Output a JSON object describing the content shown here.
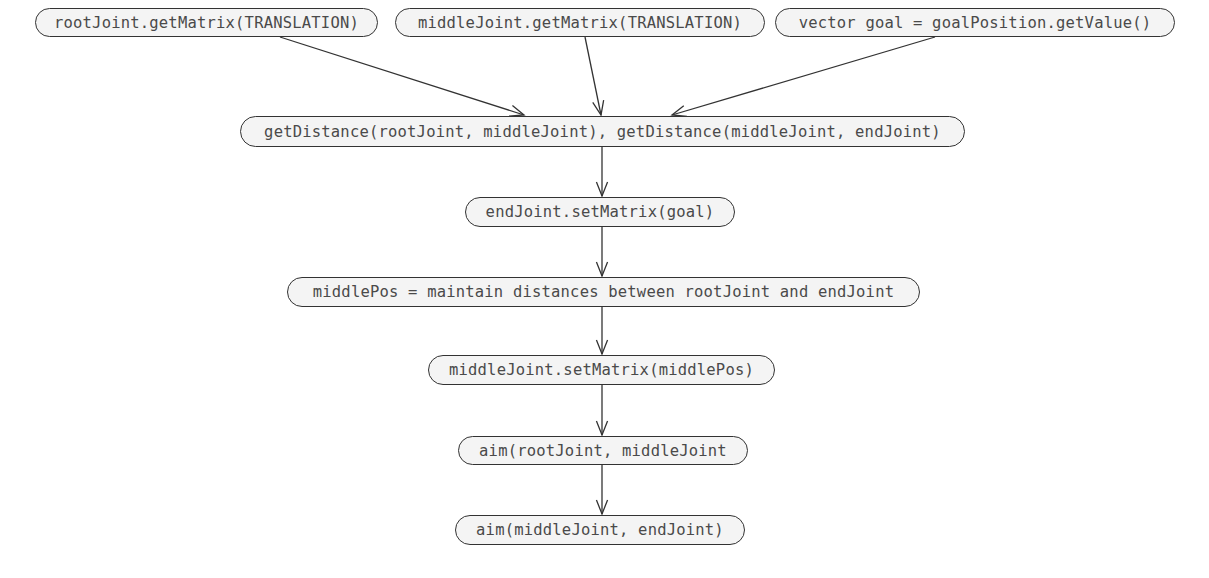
{
  "diagram": {
    "type": "flowchart",
    "nodes": [
      {
        "id": "n1",
        "label": "rootJoint.getMatrix(TRANSLATION)",
        "x": 35,
        "y": 8,
        "w": 343,
        "h": 29
      },
      {
        "id": "n2",
        "label": "middleJoint.getMatrix(TRANSLATION)",
        "x": 395,
        "y": 8,
        "w": 370,
        "h": 29
      },
      {
        "id": "n3",
        "label": "vector goal = goalPosition.getValue()",
        "x": 775,
        "y": 8,
        "w": 400,
        "h": 29
      },
      {
        "id": "n4",
        "label": "getDistance(rootJoint, middleJoint), getDistance(middleJoint, endJoint)",
        "x": 240,
        "y": 116,
        "w": 725,
        "h": 31
      },
      {
        "id": "n5",
        "label": "endJoint.setMatrix(goal)",
        "x": 465,
        "y": 197,
        "w": 270,
        "h": 30
      },
      {
        "id": "n6",
        "label": "middlePos = maintain distances between rootJoint and endJoint",
        "x": 287,
        "y": 277,
        "w": 633,
        "h": 30
      },
      {
        "id": "n7",
        "label": "middleJoint.setMatrix(middlePos)",
        "x": 428,
        "y": 355,
        "w": 347,
        "h": 30
      },
      {
        "id": "n8",
        "label": "aim(rootJoint, middleJoint",
        "x": 458,
        "y": 436,
        "w": 290,
        "h": 29
      },
      {
        "id": "n9",
        "label": "aim(middleJoint, endJoint)",
        "x": 455,
        "y": 515,
        "w": 290,
        "h": 30
      }
    ],
    "edges": [
      {
        "from": "n1",
        "to": "n4",
        "x1": 280,
        "y1": 37,
        "x2": 524,
        "y2": 115
      },
      {
        "from": "n2",
        "to": "n4",
        "x1": 585,
        "y1": 37,
        "x2": 601,
        "y2": 115
      },
      {
        "from": "n3",
        "to": "n4",
        "x1": 935,
        "y1": 37,
        "x2": 672,
        "y2": 115
      },
      {
        "from": "n4",
        "to": "n5",
        "x1": 602,
        "y1": 147,
        "x2": 602,
        "y2": 196
      },
      {
        "from": "n5",
        "to": "n6",
        "x1": 602,
        "y1": 227,
        "x2": 602,
        "y2": 276
      },
      {
        "from": "n6",
        "to": "n7",
        "x1": 602,
        "y1": 307,
        "x2": 602,
        "y2": 354
      },
      {
        "from": "n7",
        "to": "n8",
        "x1": 602,
        "y1": 385,
        "x2": 602,
        "y2": 435
      },
      {
        "from": "n8",
        "to": "n9",
        "x1": 602,
        "y1": 465,
        "x2": 602,
        "y2": 514
      }
    ],
    "colors": {
      "node_fill": "#f4f4f4",
      "node_stroke": "#333333",
      "text": "#4a4a4a",
      "edge": "#333333"
    }
  }
}
